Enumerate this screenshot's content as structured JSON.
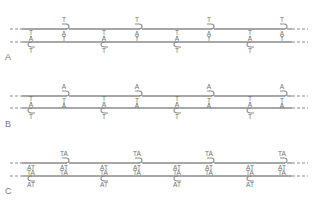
{
  "panels": [
    {
      "label": "A",
      "top_strand_y": 29,
      "bottom_strand_y": 42,
      "top_hooks": {
        "x": [
          65,
          138,
          210,
          283
        ],
        "above": "T",
        "pair_top": "A",
        "pair_bottom": "T"
      },
      "bottom_hooks": {
        "x": [
          31,
          104,
          177,
          250
        ],
        "pair_top": "T",
        "pair_bottom": "A",
        "below": "T"
      }
    },
    {
      "label": "B",
      "top_strand_y": 96,
      "bottom_strand_y": 108,
      "top_hooks": {
        "x": [
          65,
          138,
          210,
          283
        ],
        "above": "A",
        "pair_top": "T",
        "pair_bottom": "A"
      },
      "bottom_hooks": {
        "x": [
          31,
          104,
          177,
          250
        ],
        "pair_top": "T",
        "pair_bottom": "A",
        "below": "T"
      }
    },
    {
      "label": "C",
      "top_strand_y": 163,
      "bottom_strand_y": 176,
      "top_hooks": {
        "x": [
          65,
          138,
          210,
          283
        ],
        "above": "TA",
        "pair_top": "AT",
        "pair_bottom": "TA"
      },
      "bottom_hooks": {
        "x": [
          31,
          104,
          177,
          250
        ],
        "pair_top": "AT",
        "pair_bottom": "TA",
        "below": "AT"
      }
    }
  ],
  "colors": {
    "line": "#8a8a8a",
    "text": "#6f6f6f",
    "background": "#ffffff"
  }
}
